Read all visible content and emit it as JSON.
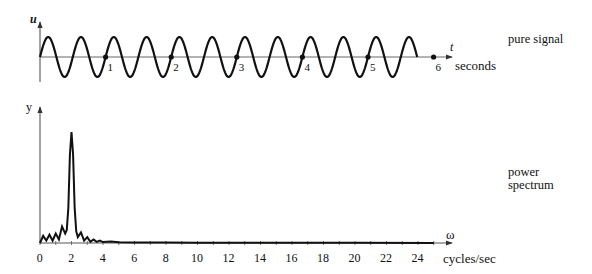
{
  "labels": {
    "top_yaxis": "u",
    "top_xaxis": "t",
    "top_xunit": "seconds",
    "top_caption": "pure signal",
    "bottom_yaxis": "y",
    "bottom_xaxis": "ω",
    "bottom_xunit": "cycles/sec",
    "bottom_caption_line1": "power",
    "bottom_caption_line2": "spectrum"
  },
  "colors": {
    "ink": "#111111",
    "axis": "#555555",
    "background": "#ffffff"
  },
  "chart_data": [
    {
      "type": "line",
      "title": "pure signal",
      "xlabel": "t (seconds)",
      "ylabel": "u",
      "function": "u = sin(2π·2·t)",
      "frequency_hz": 2,
      "x_range": [
        0,
        5.75
      ],
      "xlim": [
        0,
        6.3
      ],
      "ylim": [
        -1.2,
        1.2
      ],
      "tick_labels": [
        "1",
        "2",
        "3",
        "4",
        "5",
        "6"
      ],
      "ticks": [
        1,
        2,
        3,
        4,
        5,
        6
      ],
      "marked_points": [
        1,
        2,
        3,
        4,
        5,
        6
      ],
      "grid": false
    },
    {
      "type": "line",
      "title": "power spectrum",
      "xlabel": "ω (cycles/sec)",
      "ylabel": "y",
      "xlim": [
        0,
        26
      ],
      "ylim": [
        0,
        1.0
      ],
      "tick_labels": [
        "0",
        "2",
        "4",
        "6",
        "8",
        "10",
        "12",
        "14",
        "16",
        "18",
        "20",
        "22",
        "24"
      ],
      "ticks": [
        0,
        2,
        4,
        6,
        8,
        10,
        12,
        14,
        16,
        18,
        20,
        22,
        24
      ],
      "minor_ticks_every": 1,
      "peak": {
        "x": 2,
        "y": 0.94
      },
      "x": [
        0,
        0.2,
        0.4,
        0.6,
        0.8,
        1.0,
        1.2,
        1.4,
        1.6,
        1.7,
        1.8,
        1.9,
        2.0,
        2.1,
        2.2,
        2.3,
        2.4,
        2.6,
        2.8,
        3.0,
        3.2,
        3.4,
        3.6,
        3.8,
        4.0,
        4.5,
        5.0,
        6,
        8,
        10,
        15,
        20,
        25
      ],
      "values": [
        0.0,
        0.06,
        0.02,
        0.07,
        0.02,
        0.08,
        0.03,
        0.14,
        0.08,
        0.11,
        0.3,
        0.75,
        0.94,
        0.75,
        0.3,
        0.1,
        0.05,
        0.09,
        0.02,
        0.05,
        0.01,
        0.03,
        0.01,
        0.02,
        0.008,
        0.012,
        0.006,
        0.005,
        0.004,
        0.003,
        0.002,
        0.002,
        0.001
      ],
      "grid": false
    }
  ]
}
